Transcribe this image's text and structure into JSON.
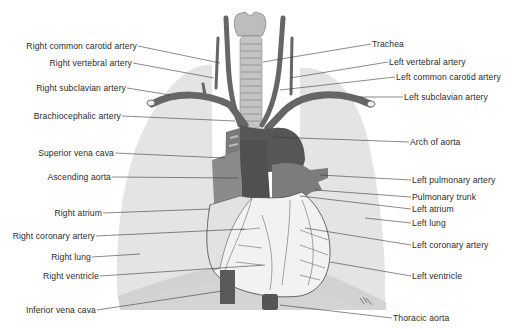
{
  "diagram": {
    "colors": {
      "lung": "#e4e4e4",
      "lung_shadow": "#cfcfcf",
      "vessel": "#6a6a6a",
      "vessel_dark": "#4c4c4c",
      "trachea": "#b9b9b9",
      "heart": "#f4f4f4",
      "leader_line": "#3a3a3a",
      "text": "#2a2a2a"
    },
    "labels_left": [
      {
        "id": "right-common-carotid-artery",
        "text": "Right common carotid artery"
      },
      {
        "id": "right-vertebral-artery",
        "text": "Right vertebral artery"
      },
      {
        "id": "right-subclavian-artery",
        "text": "Right subclavian artery"
      },
      {
        "id": "brachiocephalic-artery",
        "text": "Brachiocephalic artery"
      },
      {
        "id": "superior-vena-cava",
        "text": "Superior vena cava"
      },
      {
        "id": "ascending-aorta",
        "text": "Ascending aorta"
      },
      {
        "id": "right-atrium",
        "text": "Right atrium"
      },
      {
        "id": "right-coronary-artery",
        "text": "Right coronary artery"
      },
      {
        "id": "right-lung",
        "text": "Right lung"
      },
      {
        "id": "right-ventricle",
        "text": "Right ventricle"
      },
      {
        "id": "inferior-vena-cava",
        "text": "Inferior vena cava"
      }
    ],
    "labels_right": [
      {
        "id": "trachea",
        "text": "Trachea"
      },
      {
        "id": "left-vertebral-artery",
        "text": "Left vertebral artery"
      },
      {
        "id": "left-common-carotid-artery",
        "text": "Left common carotid artery"
      },
      {
        "id": "left-subclavian-artery",
        "text": "Left subclavian artery"
      },
      {
        "id": "arch-of-aorta",
        "text": "Arch of aorta"
      },
      {
        "id": "left-pulmonary-artery",
        "text": "Left pulmonary artery"
      },
      {
        "id": "pulmonary-trunk",
        "text": "Pulmonary trunk"
      },
      {
        "id": "left-atrium",
        "text": "Left atrium"
      },
      {
        "id": "left-lung",
        "text": "Left lung"
      },
      {
        "id": "left-coronary-artery",
        "text": "Left coronary artery"
      },
      {
        "id": "left-ventricle",
        "text": "Left ventricle"
      },
      {
        "id": "thoracic-aorta",
        "text": "Thoracic aorta"
      }
    ]
  }
}
